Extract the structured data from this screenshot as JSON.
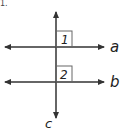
{
  "diagram": {
    "corner_mark": "1.",
    "lines": [
      {
        "id": "a",
        "label": "a",
        "orientation": "horizontal"
      },
      {
        "id": "b",
        "label": "b",
        "orientation": "horizontal"
      },
      {
        "id": "c",
        "label": "c",
        "orientation": "vertical",
        "role": "transversal"
      }
    ],
    "angles": [
      {
        "id": "1",
        "label": "1",
        "type": "right-angle"
      },
      {
        "id": "2",
        "label": "2",
        "type": "right-angle"
      }
    ],
    "colors": {
      "line": "#333333",
      "box": "#666666",
      "background": "#ffffff"
    }
  }
}
